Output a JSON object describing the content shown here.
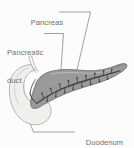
{
  "figure": {
    "kind": "anatomical-illustration",
    "subject": "pancreas",
    "width": 134,
    "height": 147,
    "background_color": "#fcfcfc",
    "style": "grayscale line drawing"
  },
  "colors": {
    "background": "#fcfcfc",
    "label_text": "#6f6f6f",
    "leader_line": "#8a8a8a",
    "pancreas_fill": "#9a9a9a",
    "pancreas_outline": "#6a6a6a",
    "duodenum_fill": "#f0efed",
    "duodenum_outline": "#a8a6a4",
    "duct_line": "#3d3d3d"
  },
  "labels": [
    {
      "id": "pancreas",
      "text": "Pancreas",
      "lines": [
        "Pancreas"
      ],
      "position": "top-center"
    },
    {
      "id": "pancreatic-duct",
      "text": "Pancreatic duct",
      "lines": [
        "Pancreatic",
        "duct"
      ],
      "position": "upper-left"
    },
    {
      "id": "duodenum",
      "text": "Duodenum",
      "lines": [
        "Duodenum"
      ],
      "position": "bottom-right"
    }
  ],
  "label_lines": {
    "pancreas_line1": "Pancreas",
    "pancreatic_duct_line1": "Pancreatic",
    "pancreatic_duct_line2": "duct",
    "duodenum_line1": "Duodenum"
  },
  "structures": [
    {
      "id": "pancreas-body",
      "name": "Pancreas",
      "description": "elongated gland angled up to the right, tapering tail"
    },
    {
      "id": "duodenum-loop",
      "name": "Duodenum",
      "description": "pale C-shaped loop cradling the pancreatic head at left"
    },
    {
      "id": "pancreatic-duct",
      "name": "Pancreatic duct",
      "description": "dark central duct with branching ductules in fishbone pattern"
    },
    {
      "id": "bile-duct-stub",
      "name": "unlabeled duct",
      "description": "thin tube rising above the pancreatic head"
    }
  ]
}
